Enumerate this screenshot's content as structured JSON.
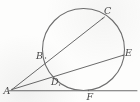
{
  "figure": {
    "width": 140,
    "height": 102,
    "background_color": "#fdfdfc",
    "stroke_color": "#6b6b6b",
    "label_color": "#4a4a4a",
    "label_style": "italic-serif"
  },
  "circle": {
    "name": "main-circle",
    "center_x": 83.5,
    "center_y": 49.5,
    "radius": 41,
    "stroke_color": "#6e6e6e",
    "stroke_width": 1.1,
    "fill": "none"
  },
  "points": [
    {
      "id": "A",
      "label": "A",
      "x": 12.0,
      "y": 89.5,
      "label_x": 3.5,
      "label_y": 85.5,
      "role": "external-apex"
    },
    {
      "id": "B",
      "label": "B",
      "x": 45.5,
      "y": 58.0,
      "label_x": 36.0,
      "label_y": 50.5,
      "role": "secant-near-intersection"
    },
    {
      "id": "C",
      "label": "C",
      "x": 102.5,
      "y": 18.5,
      "label_x": 104.0,
      "label_y": 5.5,
      "role": "secant-far-intersection"
    },
    {
      "id": "D",
      "label": "D",
      "x": 59.5,
      "y": 85.0,
      "label_x": 51.0,
      "label_y": 76.5,
      "role": "secant-near-intersection"
    },
    {
      "id": "E",
      "label": "E",
      "x": 123.0,
      "y": 55.5,
      "label_x": 125.0,
      "label_y": 47.5,
      "role": "secant-far-intersection"
    },
    {
      "id": "F",
      "label": "F",
      "x": 88.5,
      "y": 90.5,
      "label_x": 86.5,
      "label_y": 92.0,
      "role": "tangent-point"
    }
  ],
  "segments": [
    {
      "id": "AC",
      "name": "secant-a-b-c",
      "from": "A",
      "to": "C",
      "through": "B",
      "x1": 12.0,
      "y1": 89.5,
      "x2": 104.5,
      "y2": 17.0
    },
    {
      "id": "AE",
      "name": "secant-a-d-e",
      "from": "A",
      "to": "E",
      "through": "D",
      "x1": 12.0,
      "y1": 89.5,
      "x2": 124.0,
      "y2": 55.0
    },
    {
      "id": "AF",
      "name": "tangent-line-through-f",
      "from": "A",
      "to": "F",
      "x1": 9.5,
      "y1": 90.8,
      "x2": 137.0,
      "y2": 90.8
    }
  ],
  "labels": {
    "a": "A",
    "b": "B",
    "c": "C",
    "d": "D",
    "e": "E",
    "f": "F"
  }
}
